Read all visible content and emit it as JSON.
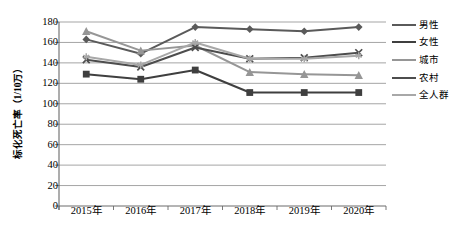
{
  "chart_data": {
    "type": "line",
    "title": "",
    "xlabel": "",
    "ylabel": "标化死亡率（1/10万）",
    "categories": [
      "2015年",
      "2016年",
      "2017年",
      "2018年",
      "2019年",
      "2020年"
    ],
    "ylim": [
      0,
      180
    ],
    "ytick_step": 20,
    "yticks": [
      180,
      160,
      140,
      120,
      100,
      80,
      60,
      40,
      20,
      0
    ],
    "grid": true,
    "legend_position": "right",
    "series": [
      {
        "name": "男性",
        "marker": "diamond",
        "color": "#5a5a5a",
        "values": [
          163,
          149,
          175,
          173,
          171,
          175
        ]
      },
      {
        "name": "女性",
        "marker": "square",
        "color": "#3f3f3f",
        "values": [
          129,
          124,
          133,
          111,
          111,
          111
        ]
      },
      {
        "name": "城市",
        "marker": "triangle",
        "color": "#969696",
        "values": [
          171,
          152,
          157,
          131,
          129,
          128
        ]
      },
      {
        "name": "农村",
        "marker": "x",
        "color": "#4d4d4d",
        "values": [
          143,
          136,
          155,
          144,
          145,
          150
        ]
      },
      {
        "name": "全人群",
        "marker": "asterisk",
        "color": "#a8a8a8",
        "values": [
          146,
          138,
          160,
          144,
          144,
          147
        ]
      }
    ]
  },
  "legend": {
    "items": [
      {
        "label": "男性"
      },
      {
        "label": "女性"
      },
      {
        "label": "城市"
      },
      {
        "label": "农村"
      },
      {
        "label": "全人群"
      }
    ]
  }
}
